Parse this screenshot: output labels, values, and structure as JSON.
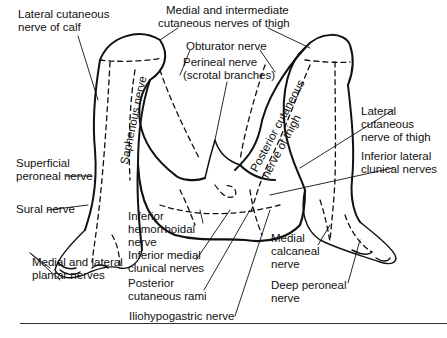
{
  "figure": {
    "labels": {
      "lateral_cutaneous_calf": [
        "Lateral cutaneous",
        "nerve of calf"
      ],
      "medial_intermediate_thigh": [
        "Medial and intermediate",
        "cutaneous nerves of thigh"
      ],
      "obturator": [
        "Obturator nerve"
      ],
      "perineal": [
        "Perineal nerve",
        "(scrotal branches)"
      ],
      "saphenous": [
        "Saphenous nerve"
      ],
      "posterior_cutaneous_thigh": [
        "Posterior cutaneous",
        "nerve of thigh"
      ],
      "lateral_cutaneous_thigh": [
        "Lateral",
        "cutaneous",
        "nerve of thigh"
      ],
      "inferior_lateral_clunical": [
        "Inferior lateral",
        "clunical nerves"
      ],
      "superficial_peroneal": [
        "Superficial",
        "peroneal nerve"
      ],
      "sural": [
        "Sural nerve"
      ],
      "medial_lateral_plantar": [
        "Medial and lateral",
        "plantar nerves"
      ],
      "inferior_hemorrhoidal": [
        "Inferior",
        "hemorrhoidal",
        "nerve"
      ],
      "inferior_medial_clunical": [
        "Inferior medial",
        "clunical nerves"
      ],
      "posterior_cutaneous_rami": [
        "Posterior",
        "cutaneous rami"
      ],
      "iliohypogastric": [
        "Iliohypogastric nerve"
      ],
      "medial_calcaneal": [
        "Medial",
        "calcaneal",
        "nerve"
      ],
      "deep_peroneal": [
        "Deep peroneal",
        "nerve"
      ]
    }
  }
}
